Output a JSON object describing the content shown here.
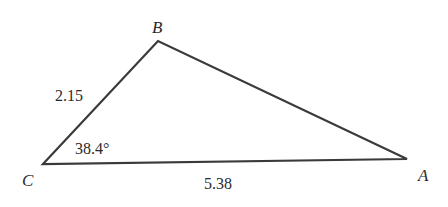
{
  "diagram": {
    "type": "triangle",
    "colors": {
      "stroke": "#3a3a3a",
      "text": "#2a2a2a",
      "background": "#ffffff"
    },
    "vertices": {
      "A": {
        "label": "A",
        "x": 407,
        "y": 159
      },
      "B": {
        "label": "B",
        "x": 158,
        "y": 41
      },
      "C": {
        "label": "C",
        "x": 43,
        "y": 164
      }
    },
    "sides": {
      "BC": {
        "label": "2.15"
      },
      "CA": {
        "label": "5.38"
      }
    },
    "angles": {
      "C": {
        "label": "38.4°"
      }
    }
  }
}
